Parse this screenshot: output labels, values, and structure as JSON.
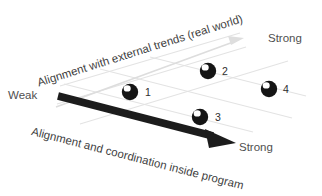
{
  "diagram": {
    "background_color": "#ffffff",
    "axes": {
      "internal": {
        "caption": "Alignment and coordination inside program",
        "start_label": "Weak",
        "end_label": "Strong",
        "color": "#1c1c1c",
        "style": "thick-black-arrow"
      },
      "external": {
        "caption": "Alignment  with external trends (real world)",
        "start_label": "Weak",
        "end_label": "Strong",
        "color": "#d8d8d8",
        "style": "thin-light-gray-arrow"
      }
    },
    "grid": {
      "color": "#e2e2e2",
      "visible": true
    },
    "markers": [
      {
        "label": "1",
        "color": "#151515",
        "highlight_color": "#ffffff"
      },
      {
        "label": "2",
        "color": "#151515",
        "highlight_color": "#ffffff"
      },
      {
        "label": "3",
        "color": "#151515",
        "highlight_color": "#ffffff"
      },
      {
        "label": "4",
        "color": "#151515",
        "highlight_color": "#ffffff"
      }
    ]
  }
}
